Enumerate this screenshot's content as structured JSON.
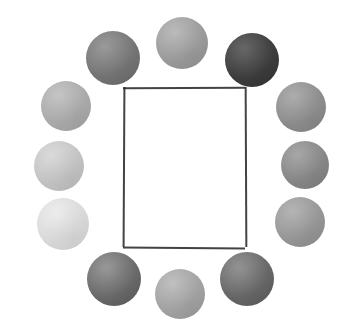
{
  "artwork": {
    "title": "Ring of Twelve Grayscale Circles Around a Rectangle",
    "background_color": "#ffffff",
    "canvas": {
      "width": 363,
      "height": 334
    },
    "frame": {
      "name": "central-rectangle",
      "x": 123,
      "y": 87,
      "width": 122,
      "height": 160,
      "stroke_color": "#2f2f2f",
      "stroke_width": 1.5,
      "fill": "#ffffff",
      "style": "hand-drawn"
    },
    "circles": [
      {
        "id": "circle-top-left",
        "label": "Top left dark gray circle",
        "cx": 113,
        "cy": 58,
        "r": 27,
        "color": "#787878",
        "color_light": "#8c8c8c",
        "color_dark": "#656565",
        "angle_deg": 210
      },
      {
        "id": "circle-top-center",
        "label": "Top center medium gray circle",
        "cx": 182,
        "cy": 43,
        "r": 26,
        "color": "#9e9e9e",
        "color_light": "#b2b2b2",
        "color_dark": "#8d8d8d",
        "angle_deg": 270
      },
      {
        "id": "circle-top-right",
        "label": "Top right darkest circle",
        "cx": 252,
        "cy": 60,
        "r": 27,
        "color": "#3f3f3f",
        "color_light": "#525252",
        "color_dark": "#303030",
        "angle_deg": 330
      },
      {
        "id": "circle-right-upper",
        "label": "Upper right gray circle",
        "cx": 301,
        "cy": 107,
        "r": 25,
        "color": "#909090",
        "color_light": "#a2a2a2",
        "color_dark": "#808080",
        "angle_deg": 0
      },
      {
        "id": "circle-right-middle",
        "label": "Middle right gray circle",
        "cx": 305,
        "cy": 165,
        "r": 24,
        "color": "#8a8a8a",
        "color_light": "#9b9b9b",
        "color_dark": "#7b7b7b",
        "angle_deg": 20
      },
      {
        "id": "circle-right-lower",
        "label": "Lower right light gray circle",
        "cx": 300,
        "cy": 222,
        "r": 25,
        "color": "#9a9a9a",
        "color_light": "#ababab",
        "color_dark": "#8a8a8a",
        "angle_deg": 40
      },
      {
        "id": "circle-bottom-right",
        "label": "Bottom right dark gray circle",
        "cx": 247,
        "cy": 279,
        "r": 27,
        "color": "#6b6b6b",
        "color_light": "#848484",
        "color_dark": "#555555",
        "angle_deg": 60
      },
      {
        "id": "circle-bottom-center",
        "label": "Bottom center medium light circle",
        "cx": 180,
        "cy": 294,
        "r": 25,
        "color": "#a5a5a5",
        "color_light": "#b8b8b8",
        "color_dark": "#969696",
        "angle_deg": 90
      },
      {
        "id": "circle-bottom-left",
        "label": "Bottom left dark gray circle",
        "cx": 114,
        "cy": 279,
        "r": 27,
        "color": "#6e6e6e",
        "color_light": "#8a8a8a",
        "color_dark": "#565656",
        "angle_deg": 120
      },
      {
        "id": "circle-left-lower",
        "label": "Lower left very light circle",
        "cx": 63,
        "cy": 224,
        "r": 26,
        "color": "#dcdcdc",
        "color_light": "#ebebeb",
        "color_dark": "#cfcfcf",
        "angle_deg": 140
      },
      {
        "id": "circle-left-middle",
        "label": "Middle left light gray circle",
        "cx": 59,
        "cy": 166,
        "r": 25,
        "color": "#c6c6c6",
        "color_light": "#d6d6d6",
        "color_dark": "#b8b8b8",
        "angle_deg": 160
      },
      {
        "id": "circle-left-upper",
        "label": "Upper left gray circle",
        "cx": 66,
        "cy": 106,
        "r": 25,
        "color": "#adadad",
        "color_light": "#bdbdbd",
        "color_dark": "#9e9e9e",
        "angle_deg": 185
      }
    ]
  }
}
